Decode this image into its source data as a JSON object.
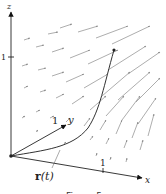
{
  "figure": {
    "type": "3d-vector-field-with-curve",
    "axes": {
      "z_label": "z",
      "x_label": "x",
      "y_label": "y",
      "z_tick": "1",
      "x_tick": "1",
      "y_tick": "1"
    },
    "curve_label_r": "r",
    "curve_label_paren": "(t)",
    "caption": "Figure 5",
    "colors": {
      "axis": "#222222",
      "curve": "#333333",
      "field_arrows": "#8a8a8a",
      "background": "#ffffff"
    }
  }
}
